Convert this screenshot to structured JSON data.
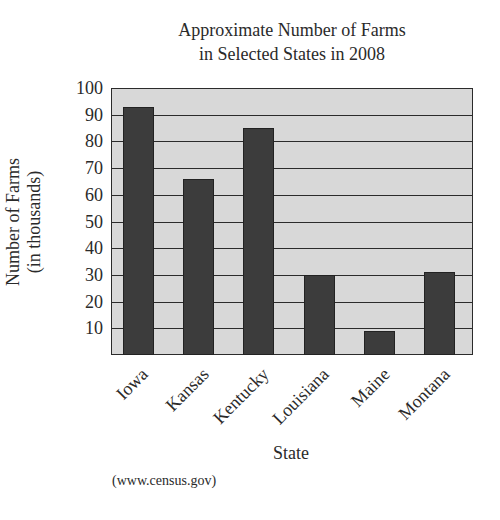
{
  "chart_data": {
    "type": "bar",
    "title": "Approximate Number of Farms in Selected States in 2008",
    "title_lines": [
      "Approximate Number of Farms",
      "in Selected States in 2008"
    ],
    "xlabel": "State",
    "ylabel": "Number of Farms (in thousands)",
    "ylabel_lines": [
      "Number of Farms",
      "(in thousands)"
    ],
    "categories": [
      "Iowa",
      "Kansas",
      "Kentucky",
      "Louisiana",
      "Maine",
      "Montana"
    ],
    "values": [
      93,
      66,
      85,
      30,
      9,
      31
    ],
    "ylim": [
      0,
      100
    ],
    "yticks": [
      10,
      20,
      30,
      40,
      50,
      60,
      70,
      80,
      90,
      100
    ],
    "grid": true,
    "legend": null,
    "source": "(www.census.gov)",
    "colors": {
      "plot_bg": "#d8d8d8",
      "bar": "#3c3c3c",
      "grid": "#2b2b2b"
    }
  }
}
